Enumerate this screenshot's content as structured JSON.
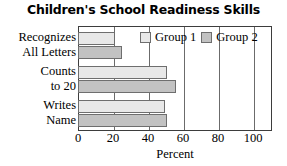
{
  "chart_data": {
    "type": "bar",
    "orientation": "horizontal",
    "title": "Children's School Readiness Skills",
    "xlabel": "Percent",
    "ylabel": "",
    "categories": [
      "Recognizes All Letters",
      "Counts to 20",
      "Writes Name"
    ],
    "category_lines": [
      [
        "Recognizes",
        "All Letters"
      ],
      [
        "Counts",
        "to 20"
      ],
      [
        "Writes",
        "Name"
      ]
    ],
    "series": [
      {
        "name": "Group 1",
        "values": [
          21,
          51,
          50
        ],
        "color": "#e8e8e8"
      },
      {
        "name": "Group 2",
        "values": [
          25,
          56,
          51
        ],
        "color": "#c2c2c2"
      }
    ],
    "xlim": [
      0,
      111
    ],
    "xticks": [
      0,
      20,
      40,
      60,
      80,
      100
    ],
    "xtick_labels": [
      "0",
      "20",
      "40",
      "60",
      "80",
      "100"
    ],
    "grid": true,
    "grid_axis": "x",
    "legend_position": "inside-top-right"
  },
  "legend": {
    "items": [
      {
        "label": "Group 1"
      },
      {
        "label": "Group 2"
      }
    ]
  },
  "axis": {
    "x_title": "Percent"
  }
}
